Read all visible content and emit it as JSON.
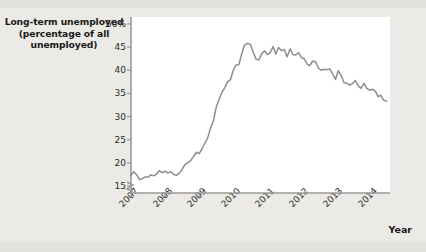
{
  "figure": {
    "background_color": "#eceae6",
    "plot_background_color": "#ffffff",
    "axis_color": "#9a9a9a",
    "line_color": "#8d8d8d",
    "text_color": "#1a1a1a"
  },
  "title_line1": "Long-term unemployed",
  "title_line2": "(percentage of all",
  "title_line3": "unemployed)",
  "axis_break_symbol": "break-mark",
  "chart_data": {
    "type": "line",
    "title": "Long-term unemployed (percentage of all unemployed)",
    "xlabel": "Year",
    "ylabel": "Long-term unemployed (percentage of all unemployed)",
    "xlim": [
      2007.0,
      2014.6
    ],
    "ylim": [
      13.5,
      51.5
    ],
    "grid": false,
    "legend": "none",
    "y_ticks": [
      15,
      20,
      25,
      30,
      35,
      40,
      45,
      50
    ],
    "y_tick_labels": [
      "15",
      "20",
      "25",
      "30",
      "35",
      "40",
      "45",
      "50%"
    ],
    "x_ticks": [
      2007,
      2008,
      2009,
      2010,
      2011,
      2012,
      2013,
      2014
    ],
    "x_tick_labels": [
      "2007",
      "2008",
      "2009",
      "2010",
      "2011",
      "2012",
      "2013",
      "2014"
    ],
    "series": [
      {
        "name": "Long-term unemployed share",
        "x": [
          2007.0,
          2007.08,
          2007.17,
          2007.25,
          2007.33,
          2007.42,
          2007.5,
          2007.58,
          2007.67,
          2007.75,
          2007.83,
          2007.92,
          2008.0,
          2008.08,
          2008.17,
          2008.25,
          2008.33,
          2008.42,
          2008.5,
          2008.58,
          2008.67,
          2008.75,
          2008.83,
          2008.92,
          2009.0,
          2009.08,
          2009.17,
          2009.25,
          2009.33,
          2009.42,
          2009.5,
          2009.58,
          2009.67,
          2009.75,
          2009.83,
          2009.92,
          2010.0,
          2010.08,
          2010.17,
          2010.25,
          2010.33,
          2010.42,
          2010.5,
          2010.58,
          2010.67,
          2010.75,
          2010.83,
          2010.92,
          2011.0,
          2011.08,
          2011.17,
          2011.25,
          2011.33,
          2011.42,
          2011.5,
          2011.58,
          2011.67,
          2011.75,
          2011.83,
          2011.92,
          2012.0,
          2012.08,
          2012.17,
          2012.25,
          2012.33,
          2012.42,
          2012.5,
          2012.58,
          2012.67,
          2012.75,
          2012.83,
          2012.92,
          2013.0,
          2013.08,
          2013.17,
          2013.25,
          2013.33,
          2013.42,
          2013.5,
          2013.58,
          2013.67,
          2013.75,
          2013.83,
          2013.92,
          2014.0,
          2014.08,
          2014.17,
          2014.25,
          2014.33,
          2014.42,
          2014.5
        ],
        "values": [
          17.3,
          18.1,
          17.4,
          16.4,
          16.6,
          17.0,
          16.9,
          17.4,
          17.2,
          17.6,
          18.3,
          17.9,
          18.2,
          17.8,
          18.1,
          17.5,
          17.3,
          17.8,
          18.6,
          19.6,
          20.0,
          20.5,
          21.3,
          22.3,
          22.0,
          23.0,
          24.3,
          25.4,
          27.4,
          29.1,
          32.0,
          33.6,
          35.3,
          36.2,
          37.5,
          38.0,
          40.0,
          41.1,
          41.3,
          43.6,
          45.4,
          45.8,
          45.6,
          44.0,
          42.4,
          42.2,
          43.5,
          44.2,
          43.4,
          43.8,
          45.1,
          43.5,
          44.9,
          44.2,
          44.5,
          42.9,
          44.6,
          43.4,
          43.3,
          43.8,
          42.7,
          42.5,
          41.3,
          41.0,
          42.0,
          41.8,
          40.5,
          40.0,
          40.2,
          40.1,
          40.3,
          39.2,
          38.0,
          39.9,
          38.8,
          37.3,
          37.2,
          36.8,
          37.1,
          37.8,
          36.6,
          36.1,
          37.2,
          36.1,
          35.7,
          35.9,
          35.5,
          34.3,
          34.6,
          33.5,
          33.3
        ]
      }
    ]
  }
}
